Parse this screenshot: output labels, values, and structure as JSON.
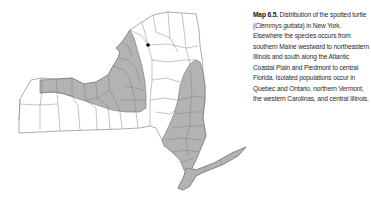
{
  "figure": {
    "label": "Map 6.5.",
    "caption_before_sci": " Distribution of the spotted turtle (",
    "scientific_name": "Clemmys guttata",
    "caption_after_sci": ") in New York. Elsewhere the species occurs from southern Maine westward to northeastern Illinois and south along the Atlantic Coastal Plain and Piedmont to central Florida. Isolated populations occur in Quebec and Ontario, northern Vermont, the western Carolinas, and central Illinois."
  },
  "map": {
    "region": "New York State",
    "subdivision": "counties",
    "colors": {
      "occupied_fill": "#b3b3b3",
      "unoccupied_fill": "#ffffff",
      "border": "#6e6e6e",
      "point": "#000000"
    },
    "legend": {
      "shaded": "counties with spotted turtle records",
      "dot": "isolated record"
    },
    "isolated_point": {
      "x": 148,
      "y": 45
    }
  }
}
